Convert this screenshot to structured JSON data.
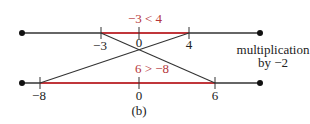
{
  "figure": {
    "caption": "(b)",
    "colors": {
      "line": "#333333",
      "highlight": "#c0363b",
      "highlight_text": "#b5353a"
    },
    "top_line": {
      "ticks": [
        {
          "label": "−3",
          "x": 101
        },
        {
          "label": "0",
          "x": 139
        },
        {
          "label": "4",
          "x": 189
        }
      ],
      "inequality": "−3 < 4"
    },
    "bottom_line": {
      "ticks": [
        {
          "label": "−8",
          "x": 40
        },
        {
          "label": "0",
          "x": 139
        },
        {
          "label": "6",
          "x": 215
        }
      ],
      "inequality": "6 > −8"
    },
    "annotation": {
      "line1": "multiplication",
      "line2": "by −2"
    }
  }
}
